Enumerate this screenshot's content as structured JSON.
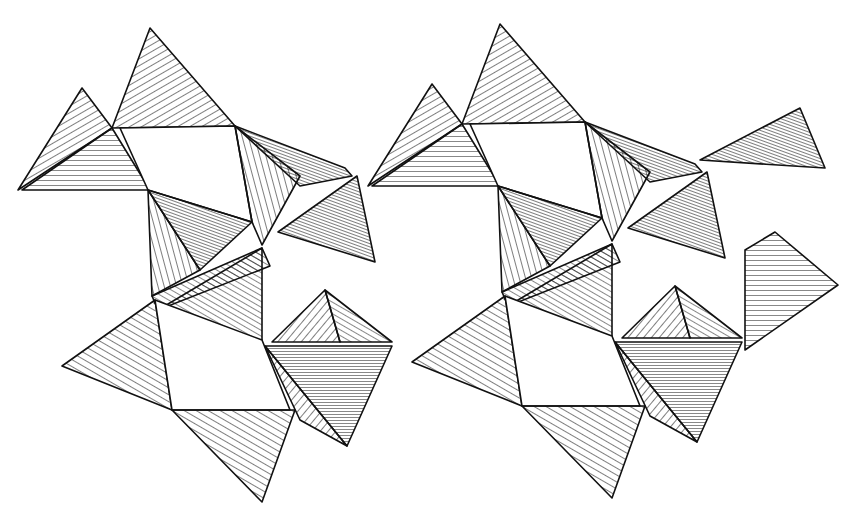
{
  "figure": {
    "ink_color": "#111111",
    "paper_color": "#ffffff",
    "repeat_offset_x": 350,
    "units": [
      {
        "name": "tetra-top-left-small",
        "points": "18,190 82,88 112,128"
      },
      {
        "name": "tetra-top-left",
        "points": "112,128 150,28 235,126"
      },
      {
        "name": "fan-left",
        "points": "30,190 112,128 148,190"
      },
      {
        "name": "octa-face-left",
        "points": "120,128 235,126 252,222 148,190"
      },
      {
        "name": "tetra-mid-left-dark",
        "points": "148,190 252,222 200,270"
      },
      {
        "name": "tetra-left-bottom",
        "points": "62,366 155,300 172,410"
      },
      {
        "name": "octa-face-lower-left",
        "points": "155,300 262,348 285,410 172,410"
      },
      {
        "name": "tetra-bottom-left",
        "points": "172,410 295,410 262,502"
      },
      {
        "name": "tetra-dark-lower",
        "points": "265,346 392,346 347,446"
      },
      {
        "name": "band-dark-top",
        "points": "235,126 345,170 355,178 300,200"
      }
    ]
  }
}
